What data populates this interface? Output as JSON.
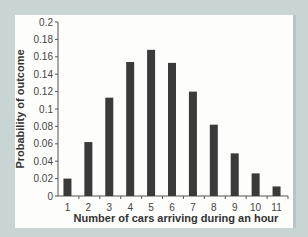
{
  "chart_data": {
    "type": "bar",
    "title": "",
    "xlabel": "Number of cars arriving during an hour",
    "ylabel": "Probability of outcome",
    "categories": [
      "1",
      "2",
      "3",
      "4",
      "5",
      "6",
      "7",
      "8",
      "9",
      "10",
      "11"
    ],
    "values": [
      0.02,
      0.062,
      0.113,
      0.154,
      0.168,
      0.153,
      0.12,
      0.082,
      0.049,
      0.026,
      0.011
    ],
    "ylim": [
      0,
      0.2
    ],
    "yticks": [
      "0",
      "0.02",
      "0.04",
      "0.06",
      "0.08",
      "0.1",
      "0.12",
      "0.14",
      "0.16",
      "0.18",
      "0.2"
    ],
    "grid": false,
    "legend": null,
    "bar_color": "#3a3a3a"
  }
}
